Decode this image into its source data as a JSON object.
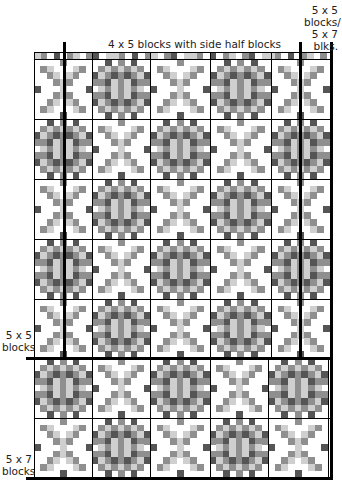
{
  "labels": {
    "top_center": "4 x 5 blocks with side half blocks",
    "top_right": [
      "5 x 5",
      "blocks/",
      "5 x 7",
      "blks."
    ],
    "left_mid": [
      "5 x 5",
      "blocks"
    ],
    "left_bottom": [
      "5 x 7",
      "blocks"
    ]
  },
  "colors": {
    "dark": "#555555",
    "medium": "#8f8f8f",
    "light": "#cfcfcf",
    "white": "#ffffff",
    "grid_line": "#000000"
  },
  "quilt": {
    "left": 34,
    "right": 330,
    "top": 52,
    "strip_bottom": 59,
    "row_lines": [
      59,
      119,
      179,
      239,
      299,
      358,
      418,
      477
    ],
    "upper_col_lines": [
      34,
      92,
      150,
      210,
      271,
      330
    ],
    "lower_col_lines": [
      34,
      92,
      150,
      210,
      268,
      328
    ],
    "thick_vertical_1": 64,
    "thick_vertical_2": 300,
    "thick_vertical_3": 330,
    "thick_horizontal": 358,
    "thick_bottom": 477,
    "block_pattern_rows": [
      [
        "X",
        "D",
        "X",
        "D",
        "X"
      ],
      [
        "D",
        "X",
        "D",
        "X",
        "D"
      ],
      [
        "X",
        "D",
        "X",
        "D",
        "X"
      ],
      [
        "D",
        "X",
        "D",
        "X",
        "D"
      ],
      [
        "X",
        "D",
        "X",
        "D",
        "X"
      ],
      [
        "D",
        "X",
        "D",
        "X",
        "D"
      ],
      [
        "X",
        "D",
        "X",
        "D",
        "X"
      ]
    ]
  }
}
